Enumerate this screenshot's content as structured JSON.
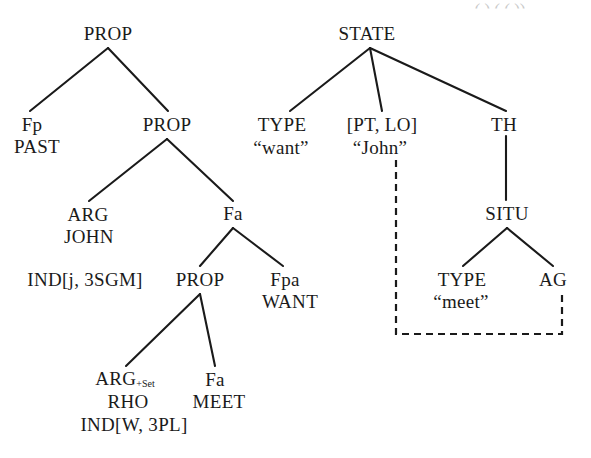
{
  "figure": {
    "width": 591,
    "height": 458,
    "line_color": "#1a1a1a",
    "text_color": "#1a1a1a",
    "background": "#ffffff",
    "cut_text_color": "#c9c9c9"
  },
  "cut_off_top_text": "( ) ( ( ))",
  "left_tree": {
    "name": "PROP tree",
    "nodes": [
      {
        "id": "prop-root",
        "label": "PROP",
        "x": 108,
        "y": 33
      },
      {
        "id": "fp",
        "label": "Fp",
        "x": 32,
        "y": 124
      },
      {
        "id": "past",
        "label": "PAST",
        "x": 37,
        "y": 146
      },
      {
        "id": "prop-2",
        "label": "PROP",
        "x": 167,
        "y": 124
      },
      {
        "id": "arg-1",
        "label": "ARG",
        "x": 88,
        "y": 214
      },
      {
        "id": "john",
        "label": "JOHN",
        "x": 89,
        "y": 236
      },
      {
        "id": "ind-j",
        "label": "IND[j, 3SGM]",
        "x": 85,
        "y": 279
      },
      {
        "id": "fa-1",
        "label": "Fa",
        "x": 233,
        "y": 213
      },
      {
        "id": "prop-3",
        "label": "PROP",
        "x": 200,
        "y": 279
      },
      {
        "id": "fpa",
        "label": "Fpa",
        "x": 285,
        "y": 279
      },
      {
        "id": "want",
        "label": "WANT",
        "x": 290,
        "y": 301
      },
      {
        "id": "arg-2",
        "label": "ARG",
        "x": 125,
        "y": 379,
        "subscript": "+Set"
      },
      {
        "id": "rho",
        "label": "RHO",
        "x": 128,
        "y": 401
      },
      {
        "id": "ind-w",
        "label": "IND[W, 3PL]",
        "x": 134,
        "y": 424
      },
      {
        "id": "fa-2",
        "label": "Fa",
        "x": 215,
        "y": 379
      },
      {
        "id": "meet",
        "label": "MEET",
        "x": 219,
        "y": 401
      }
    ],
    "edges": [
      {
        "from": "prop-root",
        "to": "fp",
        "x1": 108,
        "y1": 48,
        "x2": 30,
        "y2": 111
      },
      {
        "from": "prop-root",
        "to": "prop-2",
        "x1": 108,
        "y1": 48,
        "x2": 168,
        "y2": 111
      },
      {
        "from": "prop-2",
        "to": "arg-1",
        "x1": 167,
        "y1": 139,
        "x2": 89,
        "y2": 201
      },
      {
        "from": "prop-2",
        "to": "fa-1",
        "x1": 167,
        "y1": 139,
        "x2": 233,
        "y2": 201
      },
      {
        "from": "fa-1",
        "to": "prop-3",
        "x1": 233,
        "y1": 228,
        "x2": 200,
        "y2": 266
      },
      {
        "from": "fa-1",
        "to": "fpa",
        "x1": 233,
        "y1": 228,
        "x2": 283,
        "y2": 266
      },
      {
        "from": "prop-3",
        "to": "arg-2",
        "x1": 200,
        "y1": 294,
        "x2": 126,
        "y2": 366
      },
      {
        "from": "prop-3",
        "to": "fa-2",
        "x1": 200,
        "y1": 294,
        "x2": 215,
        "y2": 366
      }
    ]
  },
  "right_tree": {
    "name": "STATE tree",
    "nodes": [
      {
        "id": "state",
        "label": "STATE",
        "x": 367,
        "y": 33
      },
      {
        "id": "type-1",
        "label": "TYPE",
        "x": 282,
        "y": 124
      },
      {
        "id": "want-q",
        "label": "“want”",
        "x": 281,
        "y": 147
      },
      {
        "id": "pt-lo",
        "label": "[PT, LO]",
        "x": 382,
        "y": 124
      },
      {
        "id": "john-q",
        "label": "“John”",
        "x": 380,
        "y": 147
      },
      {
        "id": "th",
        "label": "TH",
        "x": 504,
        "y": 124
      },
      {
        "id": "situ",
        "label": "SITU",
        "x": 507,
        "y": 213
      },
      {
        "id": "type-2",
        "label": "TYPE",
        "x": 462,
        "y": 279
      },
      {
        "id": "meet-q",
        "label": "“meet”",
        "x": 461,
        "y": 301
      },
      {
        "id": "ag",
        "label": "AG",
        "x": 553,
        "y": 279
      }
    ],
    "edges": [
      {
        "from": "state",
        "to": "type-1",
        "x1": 370,
        "y1": 48,
        "x2": 290,
        "y2": 111
      },
      {
        "from": "state",
        "to": "pt-lo",
        "x1": 370,
        "y1": 48,
        "x2": 382,
        "y2": 111
      },
      {
        "from": "state",
        "to": "th",
        "x1": 370,
        "y1": 48,
        "x2": 506,
        "y2": 111
      },
      {
        "from": "th",
        "to": "situ",
        "x1": 506,
        "y1": 136,
        "x2": 506,
        "y2": 200
      },
      {
        "from": "situ",
        "to": "type-2",
        "x1": 507,
        "y1": 228,
        "x2": 463,
        "y2": 266
      },
      {
        "from": "situ",
        "to": "ag",
        "x1": 507,
        "y1": 228,
        "x2": 553,
        "y2": 266
      }
    ],
    "coindex_link": {
      "name": "coindexation-link",
      "style": "dashed",
      "from": "john-q",
      "to": "ag",
      "path": "M 396 160 L 396 334 L 562 334 L 562 292"
    }
  }
}
